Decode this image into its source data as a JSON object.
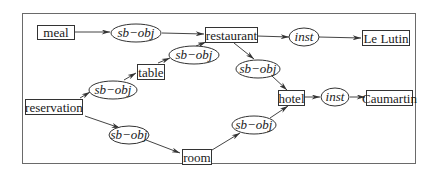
{
  "diagram": {
    "type": "conceptual-graph",
    "nodes": {
      "meal": "meal",
      "restaurant": "restaurant",
      "le_lutin": "Le Lutin",
      "table": "table",
      "reservation": "reservation",
      "hotel": "hotel",
      "caumartin": "Caumartin",
      "room": "room"
    },
    "relations": {
      "r1": "sb−obj",
      "r2": "sb−obj",
      "r3": "sb−obj",
      "r4": "sb−obj",
      "r5": "sb−obj",
      "r6": "sb−obj",
      "inst1": "inst",
      "inst2": "inst"
    },
    "edges": [
      {
        "from": "meal",
        "to": "r1"
      },
      {
        "from": "r1",
        "to": "restaurant"
      },
      {
        "from": "restaurant",
        "to": "inst1"
      },
      {
        "from": "inst1",
        "to": "le_lutin"
      },
      {
        "from": "reservation",
        "to": "r3"
      },
      {
        "from": "r3",
        "to": "table"
      },
      {
        "from": "table",
        "to": "r2"
      },
      {
        "from": "r2",
        "to": "restaurant"
      },
      {
        "from": "restaurant",
        "to": "r4"
      },
      {
        "from": "r4",
        "to": "hotel"
      },
      {
        "from": "hotel",
        "to": "inst2"
      },
      {
        "from": "inst2",
        "to": "caumartin"
      },
      {
        "from": "reservation",
        "to": "r5"
      },
      {
        "from": "r5",
        "to": "room"
      },
      {
        "from": "room",
        "to": "r6"
      },
      {
        "from": "r6",
        "to": "hotel"
      }
    ]
  }
}
